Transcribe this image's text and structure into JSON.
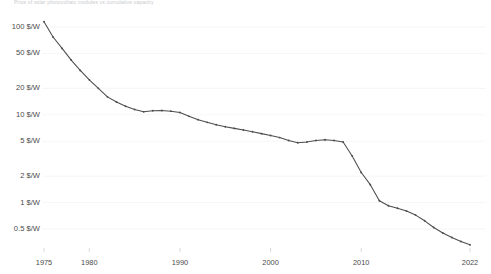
{
  "chart_data": {
    "type": "line",
    "title": "Price of solar photovoltaic modules vs cumulative capacity",
    "subtitle": "",
    "xlabel": "",
    "ylabel": "",
    "xlim": [
      1975,
      2022
    ],
    "ylim": [
      0.3,
      130
    ],
    "yscale": "log",
    "grid": true,
    "legend": "none",
    "y_tick_labels": [
      "100 $/W",
      "50 $/W",
      "20 $/W",
      "10 $/W",
      "5 $/W",
      "2 $/W",
      "1 $/W",
      "0.5 $/W"
    ],
    "y_tick_values": [
      100,
      50,
      20,
      10,
      5,
      2,
      1,
      0.5
    ],
    "x_tick_labels": [
      "1975",
      "1980",
      "1990",
      "2000",
      "2010",
      "2022"
    ],
    "x_tick_values": [
      1975,
      1980,
      1990,
      2000,
      2010,
      2022
    ],
    "unit": "$/W",
    "series": [
      {
        "name": "Solar PV module price",
        "color": "#4d4d4d",
        "x": [
          1975,
          1976,
          1977,
          1978,
          1979,
          1980,
          1981,
          1982,
          1983,
          1984,
          1985,
          1986,
          1987,
          1988,
          1989,
          1990,
          1991,
          1992,
          1993,
          1994,
          1995,
          1996,
          1997,
          1998,
          1999,
          2000,
          2001,
          2002,
          2003,
          2004,
          2005,
          2006,
          2007,
          2008,
          2009,
          2010,
          2011,
          2012,
          2013,
          2014,
          2015,
          2016,
          2017,
          2018,
          2019,
          2020,
          2021,
          2022
        ],
        "values": [
          115,
          77,
          57,
          42,
          32,
          25,
          20,
          16,
          14,
          12.5,
          11.5,
          10.8,
          11.1,
          11.2,
          11.0,
          10.6,
          9.6,
          8.8,
          8.2,
          7.7,
          7.3,
          7.0,
          6.7,
          6.4,
          6.1,
          5.8,
          5.5,
          5.1,
          4.8,
          4.9,
          5.1,
          5.2,
          5.1,
          4.9,
          3.4,
          2.2,
          1.6,
          1.05,
          0.92,
          0.86,
          0.8,
          0.72,
          0.62,
          0.52,
          0.45,
          0.4,
          0.36,
          0.33
        ]
      }
    ]
  }
}
